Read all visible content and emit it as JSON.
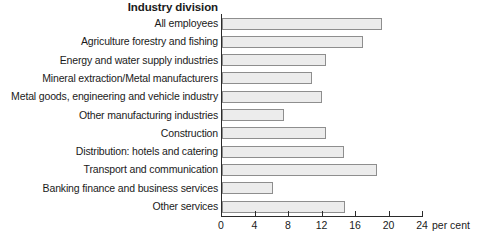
{
  "chart_data": {
    "type": "bar",
    "orientation": "horizontal",
    "title": "Industry division",
    "xlabel": "per cent",
    "ylabel": "",
    "xlim": [
      0,
      24
    ],
    "xticks": [
      0,
      4,
      8,
      12,
      16,
      20,
      24
    ],
    "grid": false,
    "legend": null,
    "categories": [
      "All employees",
      "Agriculture forestry and fishing",
      "Energy and water supply industries",
      "Mineral extraction/Metal manufacturers",
      "Metal goods, engineering and vehicle industry",
      "Other manufacturing industries",
      "Construction",
      "Distribution: hotels and catering",
      "Transport and communication",
      "Banking finance and business services",
      "Other services"
    ],
    "values": [
      19.1,
      16.8,
      12.4,
      10.7,
      11.9,
      7.4,
      12.4,
      14.6,
      18.5,
      6.1,
      14.7
    ],
    "bar_fill": "#ececec",
    "bar_border": "#8e8e8e",
    "axis_color": "#2b2b2b"
  }
}
